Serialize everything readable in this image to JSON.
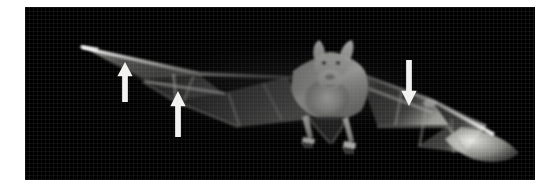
{
  "figure": {
    "domain": "natural-image",
    "caption": "",
    "page_background": "#ffffff",
    "photo": {
      "subject": "bat in flight",
      "view": "frontal, wings fully outspread",
      "background_color": "#000000",
      "palette": "grayscale",
      "left": 25,
      "top": 7,
      "width": 510,
      "height": 173,
      "anatomy_visible": [
        "left wingtip",
        "right wingtip",
        "wing membrane",
        "forearm",
        "digits",
        "head",
        "ears",
        "face",
        "hind legs",
        "feet",
        "tail membrane"
      ]
    },
    "annotations": {
      "arrow_color": "#f2f2f0",
      "items": [
        {
          "id": "arrow-1",
          "name": "annotation-arrow-up-left",
          "direction": "up",
          "x": 116,
          "y": 62,
          "width": 18,
          "height": 40,
          "points_at": "left wing membrane trailing edge"
        },
        {
          "id": "arrow-2",
          "name": "annotation-arrow-up-mid",
          "direction": "up",
          "x": 169,
          "y": 91,
          "width": 18,
          "height": 46,
          "points_at": "left wing membrane outer edge"
        },
        {
          "id": "arrow-3",
          "name": "annotation-arrow-down-right",
          "direction": "down",
          "x": 400,
          "y": 60,
          "width": 18,
          "height": 46,
          "points_at": "right wing membrane trailing edge"
        }
      ]
    }
  }
}
